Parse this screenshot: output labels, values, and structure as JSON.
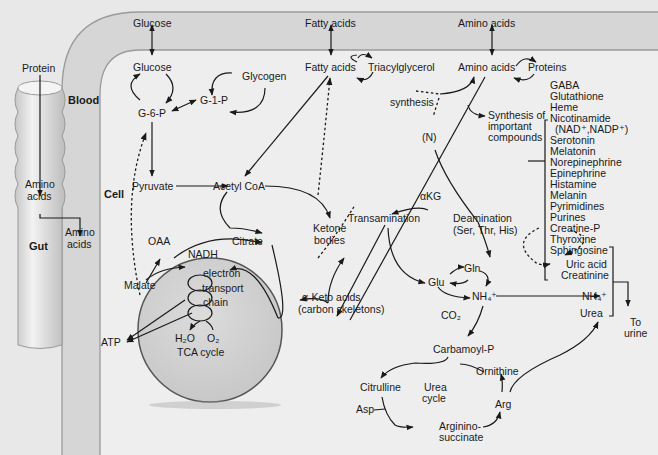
{
  "compartments": {
    "blood": "Blood",
    "cell": "Cell",
    "gut": "Gut"
  },
  "gut": {
    "protein": "Protein",
    "amino_acids_1": "Amino",
    "amino_acids_2": "acids",
    "exported_1": "Amino",
    "exported_2": "acids"
  },
  "blood": {
    "glucose": "Glucose",
    "fatty_acids": "Fatty acids",
    "amino_acids": "Amino acids"
  },
  "carbohydrate": {
    "glucose": "Glucose",
    "g6p": "G-6-P",
    "g1p": "G-1-P",
    "glycogen": "Glycogen",
    "pyruvate": "Pyruvate",
    "acetyl_coa": "Acetyl CoA"
  },
  "lipid": {
    "fatty_acids": "Fatty acids",
    "triacylglycerol": "Triacylglycerol",
    "ketone_1": "Ketone",
    "ketone_2": "bodies"
  },
  "mitochondrion": {
    "oaa": "OAA",
    "citrate": "Citrate",
    "malate": "Malate",
    "nadh": "NADH",
    "etc_1": "electron",
    "etc_2": "transport",
    "etc_3": "chain",
    "h2o": "H₂O",
    "o2": "O₂",
    "tca": "TCA cycle",
    "atp": "ATP"
  },
  "amino_acid_metabolism": {
    "amino_acids": "Amino acids",
    "proteins": "Proteins",
    "synthesis": "synthesis",
    "nitrogen": "(N)",
    "synth_1": "Synthesis of",
    "synth_2": "important",
    "synth_3": "compounds",
    "akg": "αKG",
    "transamination": "Transamination",
    "deamination_1": "Deamination",
    "deamination_2": "(Ser, Thr, His)",
    "keto_1": "α-Keto acids",
    "keto_2": "(carbon skeletons)",
    "glu": "Glu",
    "gln": "Gln",
    "nh4": "NH₄⁺",
    "co2": "CO₂"
  },
  "important_compounds": [
    "GABA",
    "Glutathione",
    "Heme",
    "Nicotinamide",
    "(NAD⁺,NADP⁺)",
    "Serotonin",
    "Melatonin",
    "Norepinephrine",
    "Epinephrine",
    "Histamine",
    "Melanin",
    "Pyrimidines",
    "Purines",
    "Creatine-P",
    "Thyroxine",
    "Sphingosine"
  ],
  "urea_cycle": {
    "carbamoyl_p": "Carbamoyl-P",
    "citrulline": "Citrulline",
    "ornithine": "Ornithine",
    "label_1": "Urea",
    "label_2": "cycle",
    "asp": "Asp",
    "arg": "Arg",
    "argsucc_1": "Arginino-",
    "argsucc_2": "succinate"
  },
  "excretion": {
    "uric_acid": "Uric acid",
    "creatinine": "Creatinine",
    "nh4": "NH₄⁺",
    "urea": "Urea",
    "urine_1": "To",
    "urine_2": "urine"
  }
}
